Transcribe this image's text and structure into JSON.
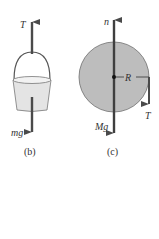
{
  "figure_b": {
    "caption": "(b)",
    "tension_label": "T",
    "weight_label": "mg"
  },
  "figure_c": {
    "caption": "(c)",
    "normal_label": "n",
    "weight_label": "Mg",
    "radius_label": "R",
    "tension_label": "T"
  },
  "colors": {
    "arrow": "#4a4a4a",
    "disk_fill": "#bdbdbd",
    "disk_stroke": "#6f6f6f",
    "bucket_fill": "#e4e4e4"
  }
}
